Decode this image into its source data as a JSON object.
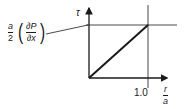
{
  "diagram": {
    "y_axis_label": "τ",
    "x_axis_label": {
      "numerator": "r",
      "denominator": "a"
    },
    "x_tick_label": "1.0",
    "annotation": {
      "coef_numerator": "a",
      "coef_denominator": "2",
      "deriv_numerator": "∂P",
      "deriv_denominator": "∂x",
      "paren_open": "(",
      "paren_close": ")"
    },
    "line_color": "#1a1a1a"
  }
}
